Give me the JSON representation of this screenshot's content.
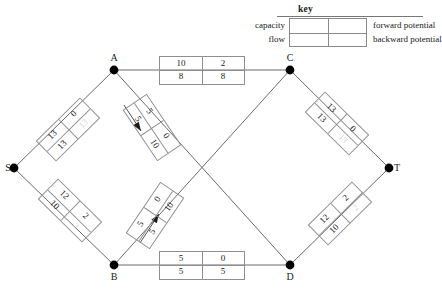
{
  "key": {
    "title": "key",
    "left_labels": {
      "capacity": "capacity",
      "flow": "flow"
    },
    "right_labels": {
      "forward": "forward potential",
      "backward": "backward potential"
    }
  },
  "nodes": [
    {
      "id": "S",
      "label": "S",
      "x": 14,
      "y": 168,
      "label_x": 8,
      "label_y": 168
    },
    {
      "id": "A",
      "label": "A",
      "x": 114,
      "y": 70,
      "label_x": 114,
      "label_y": 58
    },
    {
      "id": "B",
      "label": "B",
      "x": 114,
      "y": 265,
      "label_x": 114,
      "label_y": 277
    },
    {
      "id": "C",
      "label": "C",
      "x": 290,
      "y": 70,
      "label_x": 290,
      "label_y": 58
    },
    {
      "id": "D",
      "label": "D",
      "x": 290,
      "y": 265,
      "label_x": 290,
      "label_y": 277
    },
    {
      "id": "T",
      "label": "T",
      "x": 389,
      "y": 168,
      "label_x": 397,
      "label_y": 168
    }
  ],
  "edges": [
    {
      "id": "S-A",
      "from": "S",
      "to": "A",
      "capacity": "13",
      "forward": "0",
      "flow": "13",
      "backward": "13",
      "backward_faint": true,
      "box": {
        "cx": 68,
        "cy": 129,
        "w": 62,
        "h": 29,
        "angle": -44.5
      },
      "arrow": null
    },
    {
      "id": "S-B",
      "from": "S",
      "to": "B",
      "capacity": "12",
      "forward": "2",
      "flow": "10",
      "backward": "2",
      "backward_faint": true,
      "box": {
        "cx": 70,
        "cy": 210,
        "w": 62,
        "h": 29,
        "angle": 44.5
      },
      "arrow": null
    },
    {
      "id": "A-C",
      "from": "A",
      "to": "C",
      "capacity": "10",
      "forward": "2",
      "flow": "8",
      "backward": "8",
      "backward_faint": false,
      "box": {
        "cx": 202,
        "cy": 70,
        "w": 86,
        "h": 29,
        "angle": 0
      },
      "arrow": null
    },
    {
      "id": "B-D",
      "from": "B",
      "to": "D",
      "capacity": "5",
      "forward": "0",
      "flow": "5",
      "backward": "5",
      "backward_faint": false,
      "box": {
        "cx": 202,
        "cy": 265,
        "w": 86,
        "h": 29,
        "angle": 0
      },
      "arrow": null
    },
    {
      "id": "A-D",
      "from": "A",
      "to": "D",
      "capacity": "5",
      "forward": "0",
      "flow": "5",
      "backward": "10",
      "backward_faint": false,
      "box": {
        "cx": 152,
        "cy": 127,
        "w": 62,
        "h": 29,
        "angle": 56
      },
      "arrow": {
        "x1": 124,
        "y1": 105,
        "x2": 141,
        "y2": 131
      }
    },
    {
      "id": "B-C",
      "from": "B",
      "to": "C",
      "capacity": "5",
      "forward": "0",
      "flow": "5",
      "backward": "10",
      "backward_faint": false,
      "box": {
        "cx": 155,
        "cy": 215,
        "w": 62,
        "h": 29,
        "angle": -56
      },
      "arrow": {
        "x1": 140,
        "y1": 243,
        "x2": 159,
        "y2": 214
      }
    },
    {
      "id": "C-T",
      "from": "C",
      "to": "T",
      "capacity": "13",
      "forward": "0",
      "flow": "13",
      "backward": "13",
      "backward_faint": true,
      "box": {
        "cx": 337,
        "cy": 123,
        "w": 62,
        "h": 29,
        "angle": 44.5
      },
      "arrow": null
    },
    {
      "id": "D-T",
      "from": "D",
      "to": "T",
      "capacity": "12",
      "forward": "2",
      "flow": "10",
      "backward": "2",
      "backward_faint": true,
      "box": {
        "cx": 340,
        "cy": 213,
        "w": 62,
        "h": 29,
        "angle": -44.5
      },
      "arrow": null
    }
  ],
  "style": {
    "node_fill": "#000000",
    "edge_stroke": "#6b6b6b",
    "box_stroke": "#8f8f8f",
    "text_color": "#1a1a1a"
  }
}
